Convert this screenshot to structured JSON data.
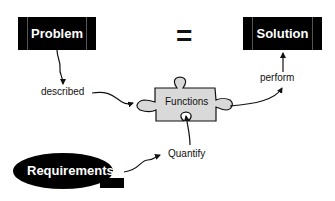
{
  "diagram": {
    "nodes": {
      "problem": {
        "label": "Problem"
      },
      "solution": {
        "label": "Solution"
      },
      "requirements": {
        "label": "Requirements"
      },
      "functions": {
        "label": "Functions"
      }
    },
    "equals_symbol": "=",
    "edge_labels": {
      "described": "described",
      "perform": "perform",
      "quantify": "Quantify"
    },
    "colors": {
      "node_fill": "#000000",
      "node_text": "#ffffff",
      "puzzle_fill": "#d9d9d9",
      "line": "#111111"
    }
  }
}
